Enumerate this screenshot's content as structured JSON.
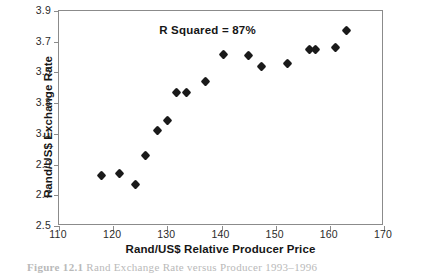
{
  "chart_data": {
    "type": "scatter",
    "title": "",
    "xlabel": "Rand/US$ Relative Producer Price",
    "ylabel": "Rand/US$ Exchange Rate",
    "xlim": [
      110,
      170
    ],
    "ylim": [
      2.5,
      3.9
    ],
    "xticks": [
      110,
      120,
      130,
      140,
      150,
      160,
      170
    ],
    "xticklabels": [
      "110",
      "120",
      "130",
      "140",
      "150",
      "160",
      "170"
    ],
    "yticks": [
      2.5,
      2.7,
      2.9,
      3.1,
      3.3,
      3.5,
      3.7,
      3.9
    ],
    "yticklabels": [
      "2.5",
      "2.7",
      "2.9",
      "3.1",
      "3.3",
      "3.5",
      "3.7",
      "3.9"
    ],
    "grid": false,
    "legend": null,
    "marker": "diamond",
    "marker_color": "#1a1a1a",
    "annotations": [
      {
        "text": "R Squared = 87%",
        "x": 128.5,
        "y": 3.77
      }
    ],
    "series": [
      {
        "name": "Rand/US$ Exchange Rate vs Relative Producer Price",
        "points": [
          {
            "x": 117.8,
            "y": 2.83
          },
          {
            "x": 121.2,
            "y": 2.84
          },
          {
            "x": 124.2,
            "y": 2.77
          },
          {
            "x": 125.9,
            "y": 2.96
          },
          {
            "x": 128.1,
            "y": 3.12
          },
          {
            "x": 130.1,
            "y": 3.19
          },
          {
            "x": 131.7,
            "y": 3.37
          },
          {
            "x": 133.6,
            "y": 3.37
          },
          {
            "x": 137.1,
            "y": 3.44
          },
          {
            "x": 140.3,
            "y": 3.62
          },
          {
            "x": 145.0,
            "y": 3.61
          },
          {
            "x": 147.4,
            "y": 3.54
          },
          {
            "x": 152.2,
            "y": 3.56
          },
          {
            "x": 156.3,
            "y": 3.65
          },
          {
            "x": 157.4,
            "y": 3.65
          },
          {
            "x": 161.0,
            "y": 3.66
          },
          {
            "x": 163.0,
            "y": 3.77
          }
        ]
      }
    ]
  },
  "caption": {
    "label": "Figure",
    "number": "12.1",
    "text": "Rand Exchange Rate versus Producer 1993–1996"
  }
}
